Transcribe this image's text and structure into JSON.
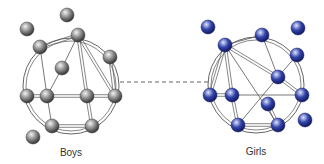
{
  "groups": [
    {
      "id": "boys",
      "label": "Boys",
      "label_pos": [
        71,
        147
      ],
      "circle": {
        "cx": 71,
        "cy": 86,
        "r": 48
      },
      "node_color": "#8a8a8a",
      "node_highlight": "#f2f2f2",
      "node_shadow": "#3c3c3c",
      "nodes": [
        {
          "id": "b1",
          "x": 67,
          "y": 15
        },
        {
          "id": "b2",
          "x": 27,
          "y": 29
        },
        {
          "id": "b3",
          "x": 78,
          "y": 35
        },
        {
          "id": "b4",
          "x": 40,
          "y": 47
        },
        {
          "id": "b5",
          "x": 110,
          "y": 57
        },
        {
          "id": "b6",
          "x": 62,
          "y": 68
        },
        {
          "id": "b7",
          "x": 27,
          "y": 96
        },
        {
          "id": "b8",
          "x": 47,
          "y": 96
        },
        {
          "id": "b9",
          "x": 87,
          "y": 96
        },
        {
          "id": "b10",
          "x": 115,
          "y": 96
        },
        {
          "id": "b11",
          "x": 52,
          "y": 126
        },
        {
          "id": "b12",
          "x": 92,
          "y": 126
        },
        {
          "id": "b13",
          "x": 33,
          "y": 137
        }
      ],
      "edges": [
        {
          "a": "b3",
          "b": "b4",
          "double": true
        },
        {
          "a": "b3",
          "b": "b6",
          "double": false
        },
        {
          "a": "b3",
          "b": "b9",
          "double": true
        },
        {
          "a": "b3",
          "b": "b10",
          "double": true
        },
        {
          "a": "b4",
          "b": "b8",
          "double": false
        },
        {
          "a": "b6",
          "b": "b8",
          "double": false
        },
        {
          "a": "b7",
          "b": "b8",
          "double": true
        },
        {
          "a": "b8",
          "b": "b9",
          "double": true
        },
        {
          "a": "b9",
          "b": "b10",
          "double": true
        },
        {
          "a": "b8",
          "b": "b11",
          "double": false
        },
        {
          "a": "b9",
          "b": "b12",
          "double": true
        },
        {
          "a": "b11",
          "b": "b12",
          "double": true
        },
        {
          "a": "b5",
          "b": "b10",
          "double": true
        }
      ]
    },
    {
      "id": "girls",
      "label": "Girls",
      "label_pos": [
        256,
        146
      ],
      "circle": {
        "cx": 256,
        "cy": 85,
        "r": 48
      },
      "node_color": "#3344aa",
      "node_highlight": "#dfe4ff",
      "node_shadow": "#141c66",
      "nodes": [
        {
          "id": "g1",
          "x": 208,
          "y": 27
        },
        {
          "id": "g2",
          "x": 298,
          "y": 28
        },
        {
          "id": "g3",
          "x": 262,
          "y": 35
        },
        {
          "id": "g4",
          "x": 225,
          "y": 45
        },
        {
          "id": "g5",
          "x": 297,
          "y": 55
        },
        {
          "id": "g6",
          "x": 278,
          "y": 77
        },
        {
          "id": "g7",
          "x": 210,
          "y": 95
        },
        {
          "id": "g8",
          "x": 232,
          "y": 95
        },
        {
          "id": "g9",
          "x": 302,
          "y": 95
        },
        {
          "id": "g10",
          "x": 268,
          "y": 104
        },
        {
          "id": "g11",
          "x": 238,
          "y": 125
        },
        {
          "id": "g12",
          "x": 278,
          "y": 125
        },
        {
          "id": "g13",
          "x": 305,
          "y": 120
        }
      ],
      "edges": [
        {
          "a": "g4",
          "b": "g3",
          "double": false
        },
        {
          "a": "g4",
          "b": "g7",
          "double": true
        },
        {
          "a": "g4",
          "b": "g8",
          "double": true
        },
        {
          "a": "g4",
          "b": "g6",
          "double": true
        },
        {
          "a": "g4",
          "b": "g12",
          "double": false
        },
        {
          "a": "g3",
          "b": "g6",
          "double": false
        },
        {
          "a": "g5",
          "b": "g6",
          "double": false
        },
        {
          "a": "g6",
          "b": "g9",
          "double": true
        },
        {
          "a": "g7",
          "b": "g8",
          "double": true
        },
        {
          "a": "g8",
          "b": "g9",
          "double": false
        },
        {
          "a": "g8",
          "b": "g11",
          "double": true
        },
        {
          "a": "g11",
          "b": "g6",
          "double": false
        },
        {
          "a": "g10",
          "b": "g12",
          "double": true
        },
        {
          "a": "g11",
          "b": "g12",
          "double": true
        }
      ]
    }
  ],
  "connector": {
    "x1": 120,
    "y1": 82,
    "x2": 210,
    "y2": 82,
    "style": "dashed",
    "color": "#555555"
  },
  "line_color": "#555555"
}
